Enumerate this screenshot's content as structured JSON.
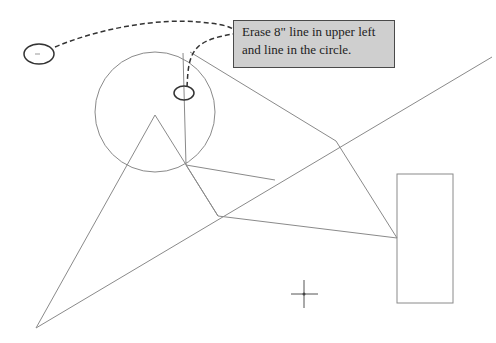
{
  "callout": {
    "line1": "Erase 8\" line in upper left",
    "line2": "and line in the circle."
  },
  "colors": {
    "background": "#ffffff",
    "drawing_line": "#8a8a8a",
    "dashed_leader": "#333333",
    "highlight_ellipse": "#333333",
    "callout_fill": "#cfcfcf",
    "callout_border": "#4a4a4a"
  }
}
